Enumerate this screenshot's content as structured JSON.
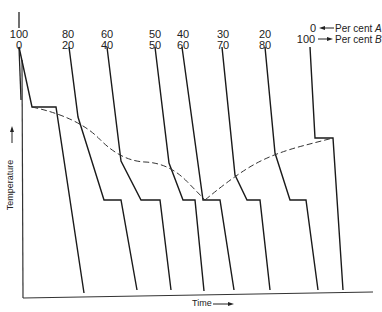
{
  "chart_data": {
    "type": "line",
    "title": "",
    "xlabel": "Time",
    "ylabel": "Temperature",
    "xlabel_arrow": "→",
    "ylabel_arrow": "→",
    "grid": false,
    "legend": {
      "row_a": {
        "label": "Per cent",
        "var": "A"
      },
      "row_b": {
        "label": "Per cent",
        "var": "B"
      }
    },
    "series": [
      {
        "name": "100/0",
        "percent_a": 100,
        "percent_b": 0,
        "points": [
          [
            19,
            47
          ],
          [
            32,
            107
          ],
          [
            56,
            107
          ],
          [
            84,
            293
          ]
        ]
      },
      {
        "name": "80/20",
        "percent_a": 80,
        "percent_b": 20,
        "points": [
          [
            69,
            47
          ],
          [
            78,
            117
          ],
          [
            104,
            200
          ],
          [
            121,
            200
          ],
          [
            137,
            290
          ]
        ]
      },
      {
        "name": "60/40",
        "percent_a": 60,
        "percent_b": 40,
        "points": [
          [
            107,
            47
          ],
          [
            121,
            161
          ],
          [
            141,
            200
          ],
          [
            160,
            200
          ],
          [
            171,
            290
          ]
        ]
      },
      {
        "name": "50/50",
        "percent_a": 50,
        "percent_b": 50,
        "points": [
          [
            155,
            47
          ],
          [
            169,
            163
          ],
          [
            183,
            200
          ],
          [
            195,
            200
          ],
          [
            204,
            291
          ]
        ]
      },
      {
        "name": "40/60",
        "percent_a": 40,
        "percent_b": 60,
        "points": [
          [
            182,
            47
          ],
          [
            203,
            200
          ],
          [
            220,
            200
          ],
          [
            234,
            290
          ]
        ]
      },
      {
        "name": "30/70",
        "percent_a": 30,
        "percent_b": 70,
        "points": [
          [
            222,
            47
          ],
          [
            235,
            175
          ],
          [
            247,
            200
          ],
          [
            260,
            200
          ],
          [
            270,
            290
          ]
        ]
      },
      {
        "name": "20/80",
        "percent_a": 20,
        "percent_b": 80,
        "points": [
          [
            265,
            47
          ],
          [
            275,
            153
          ],
          [
            290,
            200
          ],
          [
            306,
            200
          ],
          [
            318,
            290
          ]
        ]
      },
      {
        "name": "0/100",
        "percent_a": 0,
        "percent_b": 100,
        "points": [
          [
            310,
            47
          ],
          [
            315,
            138
          ],
          [
            333,
            138
          ],
          [
            343,
            290
          ]
        ]
      }
    ],
    "liquidus_left": [
      [
        32,
        107
      ],
      [
        78,
        117
      ],
      [
        121,
        161
      ],
      [
        169,
        163
      ],
      [
        205,
        200
      ]
    ],
    "liquidus_right": [
      [
        205,
        200
      ],
      [
        235,
        175
      ],
      [
        275,
        153
      ],
      [
        333,
        138
      ]
    ],
    "annotations": [
      "Eutectic arrest plateau at ~40% A / 60% B",
      "Dashed line traces liquidus (first arrest) points"
    ]
  },
  "labels": {
    "top_left_a": "100",
    "top_left_b": "0",
    "compositions": [
      {
        "a": "80",
        "b": "20",
        "x": 58
      },
      {
        "a": "60",
        "b": "40",
        "x": 98
      },
      {
        "a": "50",
        "b": "50",
        "x": 145
      },
      {
        "a": "40",
        "b": "60",
        "x": 172
      },
      {
        "a": "30",
        "b": "70",
        "x": 213
      },
      {
        "a": "20",
        "b": "80",
        "x": 255
      }
    ],
    "right_a": "0",
    "right_b": "100",
    "legend_a_text": "Per cent ",
    "legend_a_var": "A",
    "legend_b_text": "Per cent ",
    "legend_b_var": "B",
    "xlabel": "Time",
    "ylabel": "Temperature"
  }
}
